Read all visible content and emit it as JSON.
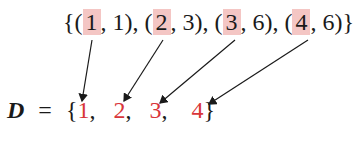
{
  "relation": {
    "open": "{",
    "close": "}",
    "pairs": [
      {
        "first": "1",
        "second": "1"
      },
      {
        "first": "2",
        "second": "3"
      },
      {
        "first": "3",
        "second": "6"
      },
      {
        "first": "4",
        "second": "6"
      }
    ]
  },
  "domain_set": {
    "variable": "D",
    "equals": "=",
    "open": "{",
    "close": "}",
    "elements": [
      "1",
      "2",
      "3",
      "4"
    ]
  },
  "colors": {
    "highlight": "#f4c6c4",
    "domain_element": "#d9363a",
    "arrow": "#1a1a1a"
  }
}
